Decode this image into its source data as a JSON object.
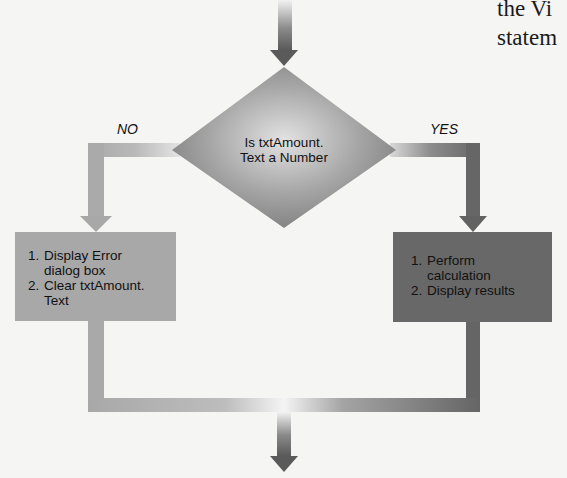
{
  "diagram": {
    "type": "flowchart",
    "decision": {
      "text": "Is txtAmount. Text a Number",
      "line1": "Is txtAmount.",
      "line2": "Text a Number"
    },
    "branches": {
      "no_label": "NO",
      "yes_label": "YES"
    },
    "no_box": {
      "items": [
        {
          "num": "1.",
          "line1": "Display Error",
          "line2": "dialog box"
        },
        {
          "num": "2.",
          "line1": "Clear txtAmount.",
          "line2": "Text"
        }
      ]
    },
    "yes_box": {
      "items": [
        {
          "num": "1.",
          "line1": "Perform",
          "line2": "calculation"
        },
        {
          "num": "2.",
          "line1": "Display results"
        }
      ]
    },
    "colors": {
      "background": "#f5f5f3",
      "no_path": "#a9a9a9",
      "yes_path": "#6a6a6a",
      "no_box": "#a8a8a8",
      "yes_box": "#686868",
      "diamond": "#9a9a9a",
      "arrow_dark": "#5e5e5e"
    }
  },
  "page_text": {
    "line1": "the Vi",
    "line2": "statem"
  }
}
